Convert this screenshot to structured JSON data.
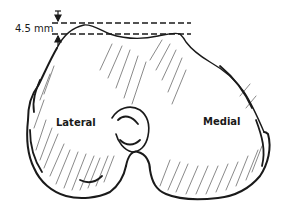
{
  "figure": {
    "labels": {
      "lateral": "Lateral",
      "medial": "Medial"
    },
    "measurement": {
      "value": "4.5 mm",
      "description": "vertical offset between two dashed reference lines"
    },
    "colors": {
      "ink": "#1a1a1a",
      "background": "#ffffff"
    }
  }
}
